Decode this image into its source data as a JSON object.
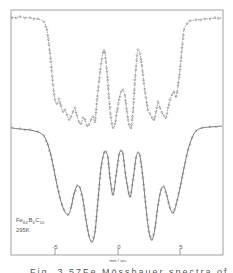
{
  "chart_data": {
    "type": "line",
    "title": "",
    "xlabel": "mm / sec",
    "ylabel": "",
    "xlim": [
      -8.6,
      8.5
    ],
    "x_ticks": [
      -5,
      0,
      5
    ],
    "x_tick_labels": [
      "-5",
      "0",
      "5"
    ],
    "grid": false,
    "legend": null,
    "annotations": [
      "Fe84 B6 C10",
      "295K"
    ],
    "sample_label": {
      "element": "Fe",
      "sub1": "84",
      "b": "B",
      "sub2": "6",
      "c": "C",
      "sub3": "10",
      "temperature": "295K"
    },
    "frame": {
      "x0": 11,
      "x1": 223,
      "y0": 10,
      "y1": 255,
      "tick_px": {
        "-5": 55,
        "0": 118,
        "5": 180
      }
    },
    "series": [
      {
        "name": "upper spectrum (dashed, open circles)",
        "style": "dashed",
        "description": "Mössbauer spectrum, relative transmission vs velocity; offset upper trace",
        "points_px": [
          [
            12,
            18
          ],
          [
            20,
            17
          ],
          [
            30,
            18
          ],
          [
            38,
            19
          ],
          [
            44,
            22
          ],
          [
            47,
            30
          ],
          [
            49,
            45
          ],
          [
            51,
            62
          ],
          [
            53,
            85
          ],
          [
            55,
            100
          ],
          [
            57,
            104
          ],
          [
            59,
            99
          ],
          [
            61,
            106
          ],
          [
            63,
            112
          ],
          [
            65,
            110
          ],
          [
            67,
            115
          ],
          [
            69,
            120
          ],
          [
            71,
            117
          ],
          [
            73,
            112
          ],
          [
            75,
            108
          ],
          [
            77,
            116
          ],
          [
            79,
            122
          ],
          [
            81,
            124
          ],
          [
            83,
            118
          ],
          [
            85,
            120
          ],
          [
            87,
            126
          ],
          [
            89,
            125
          ],
          [
            91,
            120
          ],
          [
            93,
            117
          ],
          [
            95,
            122
          ],
          [
            97,
            100
          ],
          [
            99,
            82
          ],
          [
            101,
            64
          ],
          [
            103,
            53
          ],
          [
            104,
            51
          ],
          [
            105,
            53
          ],
          [
            107,
            72
          ],
          [
            109,
            98
          ],
          [
            111,
            118
          ],
          [
            113,
            128
          ],
          [
            115,
            124
          ],
          [
            117,
            112
          ],
          [
            119,
            100
          ],
          [
            121,
            92
          ],
          [
            123,
            90
          ],
          [
            125,
            96
          ],
          [
            127,
            112
          ],
          [
            129,
            125
          ],
          [
            131,
            128
          ],
          [
            133,
            112
          ],
          [
            135,
            80
          ],
          [
            137,
            56
          ],
          [
            138,
            50
          ],
          [
            140,
            54
          ],
          [
            142,
            66
          ],
          [
            144,
            84
          ],
          [
            146,
            98
          ],
          [
            148,
            110
          ],
          [
            150,
            114
          ],
          [
            152,
            118
          ],
          [
            154,
            120
          ],
          [
            156,
            112
          ],
          [
            158,
            102
          ],
          [
            160,
            108
          ],
          [
            162,
            113
          ],
          [
            164,
            116
          ],
          [
            166,
            118
          ],
          [
            168,
            108
          ],
          [
            170,
            100
          ],
          [
            172,
            95
          ],
          [
            174,
            92
          ],
          [
            176,
            97
          ],
          [
            178,
            86
          ],
          [
            180,
            70
          ],
          [
            182,
            48
          ],
          [
            184,
            30
          ],
          [
            187,
            24
          ],
          [
            190,
            21
          ],
          [
            196,
            20
          ],
          [
            205,
            19
          ],
          [
            215,
            18
          ],
          [
            222,
            18
          ]
        ]
      },
      {
        "name": "lower spectrum (solid fit, open circles)",
        "style": "solid",
        "description": "Mössbauer spectrum with fitted curve; lower trace, six-line hyperfine pattern",
        "points_px": [
          [
            12,
            128
          ],
          [
            20,
            129
          ],
          [
            30,
            130
          ],
          [
            38,
            132
          ],
          [
            44,
            136
          ],
          [
            48,
            145
          ],
          [
            52,
            160
          ],
          [
            56,
            180
          ],
          [
            60,
            198
          ],
          [
            64,
            210
          ],
          [
            68,
            215
          ],
          [
            71,
            208
          ],
          [
            74,
            194
          ],
          [
            77,
            186
          ],
          [
            80,
            188
          ],
          [
            83,
            200
          ],
          [
            86,
            220
          ],
          [
            89,
            236
          ],
          [
            92,
            242
          ],
          [
            95,
            232
          ],
          [
            98,
            200
          ],
          [
            101,
            168
          ],
          [
            104,
            153
          ],
          [
            106,
            152
          ],
          [
            108,
            158
          ],
          [
            110,
            178
          ],
          [
            113,
            195
          ],
          [
            116,
            176
          ],
          [
            119,
            155
          ],
          [
            121,
            151
          ],
          [
            123,
            154
          ],
          [
            126,
            178
          ],
          [
            130,
            197
          ],
          [
            133,
            180
          ],
          [
            136,
            158
          ],
          [
            138,
            153
          ],
          [
            140,
            156
          ],
          [
            143,
            178
          ],
          [
            146,
            208
          ],
          [
            149,
            232
          ],
          [
            152,
            240
          ],
          [
            155,
            228
          ],
          [
            158,
            205
          ],
          [
            161,
            190
          ],
          [
            164,
            187
          ],
          [
            167,
            196
          ],
          [
            170,
            208
          ],
          [
            173,
            213
          ],
          [
            176,
            205
          ],
          [
            180,
            188
          ],
          [
            184,
            168
          ],
          [
            188,
            150
          ],
          [
            192,
            138
          ],
          [
            196,
            131
          ],
          [
            202,
            128
          ],
          [
            210,
            127
          ],
          [
            222,
            126
          ]
        ]
      }
    ],
    "peaks_lower_px": {
      "minima_x": [
        68,
        92,
        113,
        130,
        152,
        173
      ],
      "maxima_x": [
        78,
        105,
        121,
        138,
        163
      ]
    }
  },
  "figure": {
    "axis_label": "mm / sec",
    "tick_labels": [
      "-5",
      "0",
      "5"
    ],
    "sample": {
      "fe": "Fe",
      "fe_sub": "84",
      "b": "B",
      "b_sub": "6",
      "c": "C",
      "c_sub": "10"
    },
    "temperature": "295K",
    "caption_partial": "Fig. 3   57Fe Mössbauer spectra of Fe84"
  }
}
